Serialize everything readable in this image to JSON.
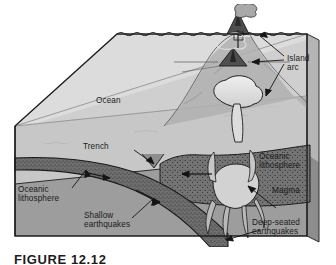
{
  "figure": {
    "caption": "FIGURE 12.12"
  },
  "colors": {
    "ocean_water": "#c9c9c9",
    "ocean_surface_top": "#d8d8d8",
    "block_side_light": "#bdbdbd",
    "mantle": "#9a9a9a",
    "mantle_dark": "#8c8c8c",
    "lithosphere_slab": "#6a6a6a",
    "magma_light": "#e2e2e2",
    "volcano_dark": "#4a4a4a",
    "outline": "#1b1b1b",
    "label_text": "#1b1b1b",
    "page_background": "#ffffff"
  },
  "labels": [
    {
      "id": "ocean",
      "text": "Ocean"
    },
    {
      "id": "island-arc",
      "text": "Island\narc"
    },
    {
      "id": "trench",
      "text": "Trench"
    },
    {
      "id": "oceanic-lithosphere-left",
      "text": "Oceanic\nlithosphere"
    },
    {
      "id": "oceanic-lithosphere-right",
      "text": "Oceanic\nlithosphere"
    },
    {
      "id": "shallow-earthquakes",
      "text": "Shallow\nearthquakes"
    },
    {
      "id": "magma",
      "text": "Magma"
    },
    {
      "id": "deep-seated-earthquakes",
      "text": "Deep-seated\nearthquakes"
    }
  ],
  "features": [
    {
      "id": "volcano-emergent",
      "name": "erupting island-arc volcano above sea level"
    },
    {
      "id": "volcano-submarine",
      "name": "submarine volcanic cone on seafloor"
    },
    {
      "id": "magma-chamber",
      "name": "rising magma body beneath the arc"
    },
    {
      "id": "subducting-slab",
      "name": "descending oceanic lithosphere slab"
    },
    {
      "id": "trench-notch",
      "name": "deep-sea trench at plate boundary"
    }
  ]
}
